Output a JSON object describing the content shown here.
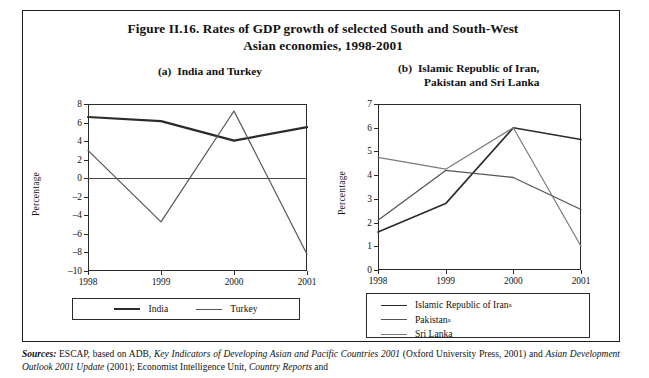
{
  "figure": {
    "title_line1": "Figure II.16.   Rates of GDP growth of selected South and South-West",
    "title_line2": "Asian economies, 1998-2001"
  },
  "panel_a": {
    "label": "(a)",
    "title": "India and Turkey",
    "legend": [
      "India",
      "Turkey"
    ]
  },
  "panel_b": {
    "label": "(b)",
    "title_line1": "Islamic Republic of Iran,",
    "title_line2": "Pakistan and Sri Lanka",
    "legend": [
      "Islamic Republic of Iran",
      "Pakistan",
      "Sri Lanka"
    ],
    "legend_footnote_marks": [
      "a",
      "a",
      ""
    ]
  },
  "sources": {
    "label": "Sources:",
    "text_1": " ESCAP, based on ADB, ",
    "italic_1": "Key Indicators of Developing Asian and Pacific Countries 2001",
    "text_2": " (Oxford University Press, 2001) and ",
    "italic_2": "Asian Development Outlook 2001 Update",
    "text_3": " (2001); Economist Intelligence Unit, ",
    "italic_3": "Country Reports",
    "text_4": " and"
  },
  "colors": {
    "series_dark": "#2b2b2b",
    "series_mid": "#555555",
    "series_light": "#7a7a7a",
    "axis": "#2a2a2a",
    "frame": "#1a1a1a"
  },
  "chart_data": [
    {
      "type": "line",
      "id": "panel-a",
      "title": "(a) India and Turkey",
      "xlabel": "",
      "ylabel": "Percentage",
      "categories": [
        "1998",
        "1999",
        "2000",
        "2001"
      ],
      "x": [
        1998,
        1999,
        2000,
        2001
      ],
      "ylim": [
        -10,
        8
      ],
      "yticks": [
        8,
        6,
        4,
        2,
        0,
        -2,
        -4,
        -6,
        -8,
        -10
      ],
      "ytick_labels": [
        "8",
        "6",
        "4",
        "2",
        "0",
        "–2",
        "–4",
        "–6",
        "–8",
        "–10"
      ],
      "grid": false,
      "legend_position": "bottom",
      "zero_line": true,
      "series": [
        {
          "name": "India",
          "values": [
            6.6,
            6.15,
            4.05,
            5.5
          ],
          "width": 2.2,
          "color": "#2b2b2b"
        },
        {
          "name": "Turkey",
          "values": [
            3.0,
            -4.7,
            7.25,
            -8.2
          ],
          "width": 1.2,
          "color": "#555555"
        }
      ]
    },
    {
      "type": "line",
      "id": "panel-b",
      "title": "(b) Islamic Republic of Iran, Pakistan and Sri Lanka",
      "xlabel": "",
      "ylabel": "Percentage",
      "categories": [
        "1998",
        "1999",
        "2000",
        "2001"
      ],
      "x": [
        1998,
        1999,
        2000,
        2001
      ],
      "ylim": [
        0,
        7
      ],
      "yticks": [
        7,
        6,
        5,
        4,
        3,
        2,
        1,
        0
      ],
      "ytick_labels": [
        "7",
        "6",
        "5",
        "4",
        "3",
        "2",
        "1",
        "0"
      ],
      "grid": false,
      "legend_position": "bottom",
      "zero_line": false,
      "series": [
        {
          "name": "Islamic Republic of Iran",
          "values": [
            1.6,
            2.8,
            6.0,
            5.5
          ],
          "width": 1.6,
          "color": "#2b2b2b"
        },
        {
          "name": "Pakistan",
          "values": [
            2.1,
            4.2,
            3.9,
            2.55
          ],
          "width": 1.3,
          "color": "#555555"
        },
        {
          "name": "Sri Lanka",
          "values": [
            4.75,
            4.25,
            6.0,
            1.0
          ],
          "width": 1.2,
          "color": "#7a7a7a"
        }
      ]
    }
  ]
}
